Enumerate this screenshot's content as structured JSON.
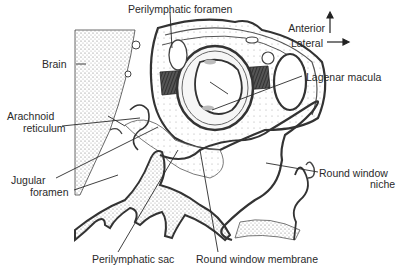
{
  "figure": {
    "type": "anatomical-section",
    "orientation": {
      "anterior_label": "Anterior",
      "lateral_label": "Lateral"
    },
    "labels": {
      "perilymphatic_foramen": "Perilymphatic foramen",
      "brain": "Brain",
      "lagenar_macula": "Lagenar macula",
      "arachnoid_line1": "Arachnoid",
      "arachnoid_line2": "reticulum",
      "jugular_line1": "Jugular",
      "jugular_line2": "foramen",
      "round_window_niche_line1": "Round window",
      "round_window_niche_line2": "niche",
      "perilymphatic_sac": "Perilymphatic sac",
      "round_window_membrane": "Round window membrane"
    },
    "colors": {
      "ink": "#2a2a2a",
      "stipple": "#8a8a8a",
      "background": "#ffffff"
    }
  }
}
